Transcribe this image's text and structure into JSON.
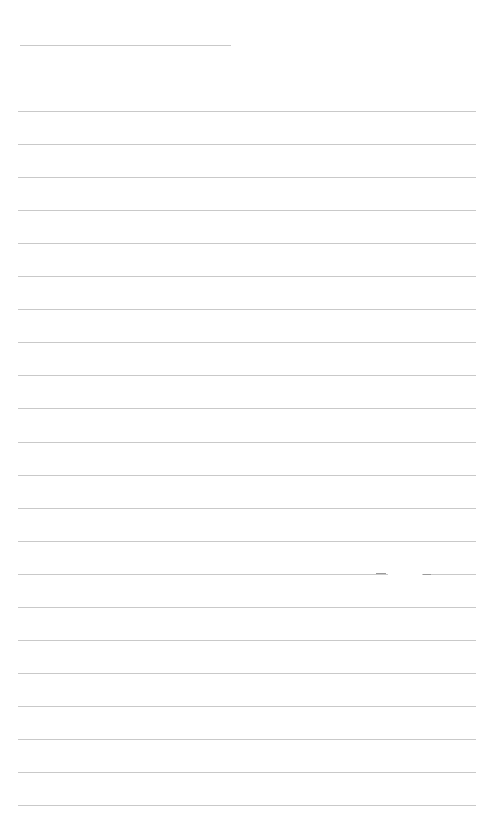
{
  "page": {
    "type": "lined-paper",
    "background_color": "#ffffff",
    "line_color": "#c9c9c9",
    "header_line": {
      "x": 20,
      "y": 45,
      "width": 211
    },
    "ruled_lines": {
      "x": 18,
      "width": 458,
      "start_y": 111,
      "spacing": 33.05,
      "count": 22
    },
    "text_content": ""
  }
}
